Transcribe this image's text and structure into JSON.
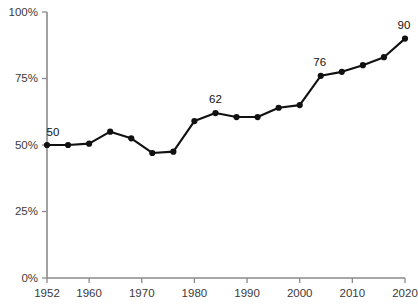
{
  "chart_data": {
    "type": "line",
    "title": "",
    "subtitle": "",
    "xlabel": "",
    "ylabel": "",
    "grid": false,
    "legend": "none",
    "xlim": [
      1952,
      2020
    ],
    "ylim": [
      0,
      100
    ],
    "x": [
      1952,
      1956,
      1960,
      1964,
      1968,
      1972,
      1976,
      1980,
      1984,
      1988,
      1992,
      1996,
      2000,
      2004,
      2008,
      2012,
      2016,
      2020
    ],
    "values": [
      50,
      50,
      50.5,
      55,
      52.5,
      47,
      47.5,
      59,
      62,
      60.5,
      60.5,
      64,
      65,
      76,
      77.5,
      80,
      83,
      90
    ],
    "series": [
      {
        "name": "",
        "values": [
          50,
          50,
          50.5,
          55,
          52.5,
          47,
          47.5,
          59,
          62,
          60.5,
          60.5,
          64,
          65,
          76,
          77.5,
          80,
          83,
          90
        ]
      }
    ],
    "categories": [
      "1952",
      "1956",
      "1960",
      "1964",
      "1968",
      "1972",
      "1976",
      "1980",
      "1984",
      "1988",
      "1992",
      "1996",
      "2000",
      "2004",
      "2008",
      "2012",
      "2016",
      "2020"
    ],
    "xticks": [
      1952,
      1960,
      1970,
      1980,
      1990,
      2000,
      2010,
      2020
    ],
    "xtick_labels": [
      "1952",
      "1960",
      "1970",
      "1980",
      "1990",
      "2000",
      "2010",
      "2020"
    ],
    "yticks": [
      0,
      25,
      50,
      75,
      100
    ],
    "ytick_labels": [
      "0%",
      "25%",
      "50%",
      "75%",
      "100%"
    ],
    "point_labels": [
      {
        "x": 1952,
        "y": 50,
        "text": "50",
        "dx": 6,
        "dy": -9
      },
      {
        "x": 1984,
        "y": 62,
        "text": "62",
        "dx": 0,
        "dy": -10
      },
      {
        "x": 2004,
        "y": 76,
        "text": "76",
        "dx": -1,
        "dy": -10
      },
      {
        "x": 2020,
        "y": 90,
        "text": "90",
        "dx": -1,
        "dy": -10
      }
    ],
    "colors": {
      "line": "#111111",
      "marker": "#111111",
      "axis": "#8a8a8a",
      "tick_text": "#3a3a3a",
      "label_text": "#111111",
      "background": "#ffffff"
    }
  }
}
